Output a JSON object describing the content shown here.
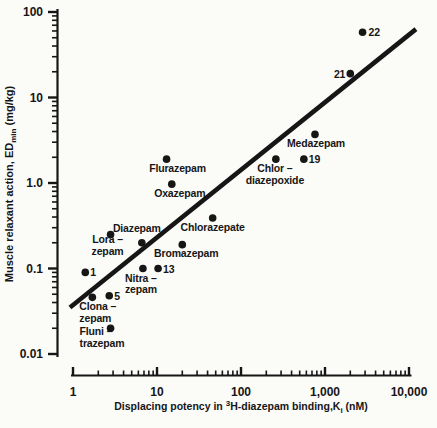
{
  "figure": {
    "background": "#fbfbf8",
    "ink": "#161616"
  },
  "chart_data": {
    "type": "scatter",
    "aria_label": "Log-log scatter plot: muscle relaxant action EDmin (mg/kg) versus displacing potency in 3H-diazepam binding Ki (nM), with regression line",
    "title": "",
    "x_axis": {
      "scale": "log",
      "range": [
        1,
        10000
      ],
      "label_segments": [
        {
          "t": "Displacing potency in "
        },
        {
          "t": "3",
          "style": "sup"
        },
        {
          "t": "H-diazepam binding,K",
          "style": ""
        },
        {
          "t": "i",
          "style": "sub"
        },
        {
          "t": " (nM)",
          "style": ""
        }
      ],
      "major_ticks": [
        {
          "value": 1,
          "label": "1"
        },
        {
          "value": 10,
          "label": "10"
        },
        {
          "value": 100,
          "label": "100"
        },
        {
          "value": 1000,
          "label": "1,000"
        },
        {
          "value": 10000,
          "label": "10,000"
        }
      ],
      "minor_tick_multipliers": [
        2,
        3,
        4,
        5,
        6,
        7,
        8,
        9
      ],
      "minor_decade_exponents": [
        0,
        1,
        2,
        3
      ]
    },
    "y_axis": {
      "scale": "log",
      "range": [
        0.01,
        100
      ],
      "label_segments": [
        {
          "t": "Muscle relaxant action, ED"
        },
        {
          "t": "min",
          "style": "sub"
        },
        {
          "t": " (mg/kg)",
          "style": ""
        }
      ],
      "major_ticks": [
        {
          "value": 100,
          "label": "100"
        },
        {
          "value": 10,
          "label": "10"
        },
        {
          "value": 1,
          "label": "1.0"
        },
        {
          "value": 0.1,
          "label": "0.1"
        },
        {
          "value": 0.01,
          "label": "0.01"
        }
      ],
      "minor_tick_multipliers": [
        2,
        3,
        4,
        5,
        6,
        7,
        8,
        9
      ],
      "minor_decade_exponents": [
        -2,
        -1,
        0,
        1
      ]
    },
    "regression_line": {
      "x1_ki": 0.92,
      "y1_ed": 0.035,
      "x2_ki": 12100,
      "y2_ed": 63
    },
    "points": [
      {
        "id": "compound-1",
        "label_lines": [
          "1"
        ],
        "ki_nM": 1.4,
        "ed_mg_kg": 0.09,
        "anchor": "start",
        "dx": 5,
        "dy": 4,
        "lh": 11.5
      },
      {
        "id": "clonazepam",
        "label_lines": [
          "Clona –",
          "zepam"
        ],
        "ki_nM": 1.7,
        "ed_mg_kg": 0.046,
        "anchor": "start",
        "dx": -13,
        "dy": 13,
        "lh": 11.5
      },
      {
        "id": "compound-5",
        "label_lines": [
          "5"
        ],
        "ki_nM": 2.7,
        "ed_mg_kg": 0.048,
        "anchor": "start",
        "dx": 5,
        "dy": 4,
        "lh": 11.5
      },
      {
        "id": "flunitrazepam",
        "label_lines": [
          "Fluni –",
          "trazepam"
        ],
        "ki_nM": 2.8,
        "ed_mg_kg": 0.02,
        "anchor": "start",
        "dx": -31,
        "dy": 7,
        "lh": 11.5
      },
      {
        "id": "lorazepam",
        "label_lines": [
          "Lora –",
          "zepam"
        ],
        "ki_nM": 2.8,
        "ed_mg_kg": 0.25,
        "anchor": "middle",
        "dx": -3,
        "dy": 9,
        "lh": 11.5
      },
      {
        "id": "diazepam",
        "label_lines": [
          "Diazepam"
        ],
        "ki_nM": 6.6,
        "ed_mg_kg": 0.2,
        "anchor": "middle",
        "dx": -5,
        "dy": -11,
        "lh": 11.5
      },
      {
        "id": "nitrazepam",
        "label_lines": [
          "Nitra –",
          "zepam"
        ],
        "ki_nM": 6.8,
        "ed_mg_kg": 0.1,
        "anchor": "middle",
        "dx": -2,
        "dy": 13,
        "lh": 11.5
      },
      {
        "id": "compound-13",
        "label_lines": [
          "13"
        ],
        "ki_nM": 10.3,
        "ed_mg_kg": 0.1,
        "anchor": "start",
        "dx": 5,
        "dy": 4,
        "lh": 11.5
      },
      {
        "id": "flurazepam",
        "label_lines": [
          "Flurazepam"
        ],
        "ki_nM": 13,
        "ed_mg_kg": 1.9,
        "anchor": "middle",
        "dx": 11,
        "dy": 13,
        "lh": 11.5
      },
      {
        "id": "oxazepam",
        "label_lines": [
          "Oxazepam"
        ],
        "ki_nM": 15,
        "ed_mg_kg": 0.97,
        "anchor": "middle",
        "dx": 8,
        "dy": 13,
        "lh": 11.5
      },
      {
        "id": "bromazepam",
        "label_lines": [
          "Bromazepam"
        ],
        "ki_nM": 20,
        "ed_mg_kg": 0.19,
        "anchor": "middle",
        "dx": 4,
        "dy": 12,
        "lh": 11.5
      },
      {
        "id": "chlorazepate",
        "label_lines": [
          "Chlorazepate"
        ],
        "ki_nM": 46,
        "ed_mg_kg": 0.39,
        "anchor": "middle",
        "dx": 0,
        "dy": 13,
        "lh": 11.5
      },
      {
        "id": "chlordiazepoxide",
        "label_lines": [
          "Chlor –",
          "diazepoxide"
        ],
        "ki_nM": 260,
        "ed_mg_kg": 1.9,
        "anchor": "middle",
        "dx": -1,
        "dy": 13,
        "lh": 11.5
      },
      {
        "id": "compound-19",
        "label_lines": [
          "19"
        ],
        "ki_nM": 560,
        "ed_mg_kg": 1.9,
        "anchor": "start",
        "dx": 5,
        "dy": 4,
        "lh": 11.5
      },
      {
        "id": "medazepam",
        "label_lines": [
          "Medazepam"
        ],
        "ki_nM": 760,
        "ed_mg_kg": 3.7,
        "anchor": "middle",
        "dx": 1,
        "dy": 13,
        "lh": 11.5
      },
      {
        "id": "compound-21",
        "label_lines": [
          "21"
        ],
        "ki_nM": 2000,
        "ed_mg_kg": 19,
        "anchor": "end",
        "dx": -5,
        "dy": 4,
        "lh": 11.5
      },
      {
        "id": "compound-22",
        "label_lines": [
          "22"
        ],
        "ki_nM": 2800,
        "ed_mg_kg": 58,
        "anchor": "start",
        "dx": 6,
        "dy": 4,
        "lh": 11.5
      }
    ]
  }
}
